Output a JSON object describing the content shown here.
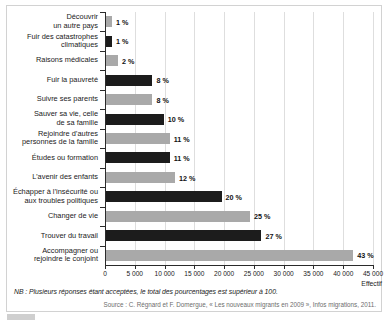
{
  "chart_data": {
    "type": "bar",
    "orientation": "horizontal",
    "title": "",
    "xlabel": "Effectif",
    "ylabel": "",
    "xlim": [
      0,
      45000
    ],
    "xticks": [
      0,
      5000,
      10000,
      15000,
      20000,
      25000,
      30000,
      35000,
      40000,
      45000
    ],
    "xticklabels": [
      "0",
      "5 000",
      "10 000",
      "15 000",
      "20 000",
      "25 000",
      "30 000",
      "35 000",
      "40 000",
      "45 000"
    ],
    "grid": true,
    "legend": "none",
    "categories": [
      "Découvrir\nun autre pays",
      "Fuir des catastrophes\nclimatiques",
      "Raisons médicales",
      "Fuir la pauvreté",
      "Suivre ses parents",
      "Sauver sa vie, celle\nde sa famille",
      "Rejoindre d’autres\npersonnes de la famille",
      "Études ou formation",
      "L’avenir des enfants",
      "Échapper à l’insécurité ou\naux troubles politiques",
      "Changer de vie",
      "Trouver du travail",
      "Accompagner ou\nrejoindre le conjoint"
    ],
    "values": [
      1000,
      1000,
      2000,
      7800,
      7800,
      9700,
      10700,
      10700,
      11600,
      19400,
      24200,
      26100,
      41500
    ],
    "data_labels": [
      "1 %",
      "1 %",
      "2 %",
      "8 %",
      "8 %",
      "10 %",
      "11 %",
      "11 %",
      "12 %",
      "20 %",
      "25 %",
      "27 %",
      "43 %"
    ],
    "percentages": [
      1,
      1,
      2,
      8,
      8,
      10,
      11,
      11,
      12,
      20,
      25,
      27,
      43
    ],
    "bar_colors": [
      "#a9a9a9",
      "#1c1c1c",
      "#a9a9a9",
      "#1c1c1c",
      "#a9a9a9",
      "#1c1c1c",
      "#a9a9a9",
      "#1c1c1c",
      "#a9a9a9",
      "#1c1c1c",
      "#a9a9a9",
      "#1c1c1c",
      "#a9a9a9"
    ],
    "colors": {
      "dark": "#1c1c1c",
      "light": "#a9a9a9",
      "grid": "#dedede",
      "axis": "#2b2b2b",
      "frame": "#d2d2d2"
    }
  },
  "notes": {
    "nb": "NB : Plusieurs réponses étant acceptées, le total des pourcentages est supérieur à 100.",
    "source": "Source : C. Régnard et F. Domergue, « Les nouveaux migrants en 2009 », Infos migrations, 2011."
  }
}
